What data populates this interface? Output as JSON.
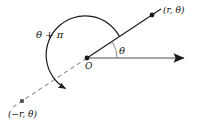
{
  "figure": {
    "width": 197,
    "height": 131,
    "background_color": "#ffffff"
  },
  "labels": {
    "point_positive": "(r, θ)",
    "point_negative": "(−r, θ)",
    "angle_theta_plus_pi": "θ + π",
    "angle_theta": "θ",
    "origin": "O"
  },
  "colors": {
    "stroke_dark": "#1a1a1a",
    "stroke_gray": "#8a8a8a",
    "stroke_dashed": "#9a9a9a",
    "text": "#111111",
    "background": "#ffffff"
  },
  "geometry": {
    "origin": {
      "x": 87,
      "y": 58
    },
    "polar_axis_end": {
      "x": 190,
      "y": 58
    },
    "point_positive": {
      "x": 152,
      "y": 15
    },
    "ray_positive_end": {
      "x": 160,
      "y": 10
    },
    "point_negative": {
      "x": 22,
      "y": 101
    },
    "ray_negative_end": {
      "x": 14,
      "y": 106
    },
    "theta_arc_radius": 30,
    "theta_pi_arc_radius": 39,
    "theta_degrees": 33,
    "theta_plus_pi_degrees": 213
  },
  "elements": [
    {
      "name": "polar-axis-ray",
      "kind": "arrow",
      "color": "#8a8a8a"
    },
    {
      "name": "terminal-ray-positive",
      "kind": "line",
      "color": "#1a1a1a"
    },
    {
      "name": "terminal-ray-negative",
      "kind": "dashed-line",
      "color": "#9a9a9a"
    },
    {
      "name": "origin-dot",
      "kind": "dot",
      "color": "#1a1a1a"
    },
    {
      "name": "point-positive-dot",
      "kind": "dot",
      "color": "#1a1a1a"
    },
    {
      "name": "point-negative-dot",
      "kind": "dot",
      "color": "#1a1a1a"
    },
    {
      "name": "theta-arc",
      "kind": "arc",
      "color": "#8a8a8a"
    },
    {
      "name": "theta-plus-pi-arc",
      "kind": "arc-arrow",
      "color": "#1a1a1a"
    }
  ]
}
